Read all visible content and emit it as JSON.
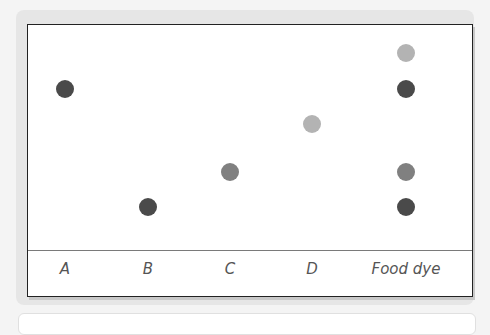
{
  "colors": {
    "dark": "#4a4a4a",
    "medium": "#808080",
    "light": "#b3b3b3"
  },
  "lanes": [
    {
      "label": "A",
      "x": 37
    },
    {
      "label": "B",
      "x": 120
    },
    {
      "label": "C",
      "x": 202
    },
    {
      "label": "D",
      "x": 284
    },
    {
      "label": "Food dye",
      "x": 378
    }
  ],
  "spots": [
    {
      "lane": "A",
      "x": 37,
      "y": 64,
      "shade": "dark"
    },
    {
      "lane": "B",
      "x": 120,
      "y": 182,
      "shade": "dark"
    },
    {
      "lane": "C",
      "x": 202,
      "y": 147,
      "shade": "medium"
    },
    {
      "lane": "D",
      "x": 284,
      "y": 99,
      "shade": "light"
    },
    {
      "lane": "Food dye",
      "x": 378,
      "y": 28,
      "shade": "light"
    },
    {
      "lane": "Food dye",
      "x": 378,
      "y": 64,
      "shade": "dark"
    },
    {
      "lane": "Food dye",
      "x": 378,
      "y": 147,
      "shade": "medium"
    },
    {
      "lane": "Food dye",
      "x": 378,
      "y": 182,
      "shade": "dark"
    }
  ],
  "chart_data": {
    "type": "scatter",
    "title": "",
    "categories": [
      "A",
      "B",
      "C",
      "D",
      "Food dye"
    ],
    "series": [
      {
        "name": "A",
        "spots": [
          {
            "height_rank": 2,
            "shade": "dark"
          }
        ]
      },
      {
        "name": "B",
        "spots": [
          {
            "height_rank": 5,
            "shade": "dark"
          }
        ]
      },
      {
        "name": "C",
        "spots": [
          {
            "height_rank": 4,
            "shade": "medium"
          }
        ]
      },
      {
        "name": "D",
        "spots": [
          {
            "height_rank": 3,
            "shade": "light"
          }
        ]
      },
      {
        "name": "Food dye",
        "spots": [
          {
            "height_rank": 1,
            "shade": "light"
          },
          {
            "height_rank": 2,
            "shade": "dark"
          },
          {
            "height_rank": 4,
            "shade": "medium"
          },
          {
            "height_rank": 5,
            "shade": "dark"
          }
        ]
      }
    ],
    "xlabel": "",
    "ylabel": "",
    "grid": false
  }
}
